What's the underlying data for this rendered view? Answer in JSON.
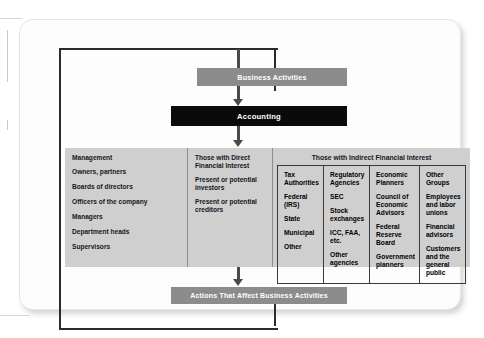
{
  "diagram": {
    "colors": {
      "process_gray": "#8c8c8c",
      "accounting_black": "#0a0a0a",
      "panel_gray": "#cfcfcf",
      "frame_black": "#2b2b2b",
      "connector_gray": "#4a4a4a"
    },
    "flow": {
      "business_activities": "Business Activities",
      "accounting": "Accounting",
      "actions": "Actions That Affect Business Activities"
    },
    "columns": {
      "internal": {
        "heading": "Management",
        "items": [
          "Owners, partners",
          "Boards of directors",
          "Officers of the company",
          "Managers",
          "Department heads",
          "Supervisors"
        ]
      },
      "direct": {
        "heading": "Those with Direct Financial Interest",
        "items": [
          "Present or potential investors",
          "Present or potential creditors"
        ]
      },
      "indirect": {
        "heading": "Those with Indirect Financial Interest",
        "groups": [
          {
            "heading": "Tax Authorities",
            "items": [
              "Federal (IRS)",
              "State",
              "Municipal",
              "Other"
            ]
          },
          {
            "heading": "Regulatory Agencies",
            "items": [
              "SEC",
              "Stock exchanges",
              "ICC, FAA, etc.",
              "Other agencies"
            ]
          },
          {
            "heading": "Economic Planners",
            "items": [
              "Council of Economic Advisors",
              "Federal Reserve Board",
              "Government planners"
            ]
          },
          {
            "heading": "Other Groups",
            "items": [
              "Employees and labor unions",
              "Financial advisors",
              "Customers and the general public"
            ]
          }
        ]
      }
    }
  }
}
